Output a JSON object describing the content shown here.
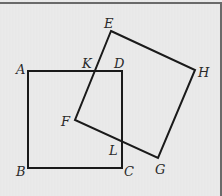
{
  "diagram": {
    "title": "",
    "colors": {
      "line": "#1a1a1a",
      "background": "#e9e9e9",
      "label": "#2a2a2a",
      "frame": "#6a6a6a"
    },
    "square1": {
      "name": "ABCD",
      "vertices": [
        "A",
        "B",
        "C",
        "D"
      ]
    },
    "square2": {
      "name": "EFGH",
      "vertices": [
        "E",
        "F",
        "G",
        "H"
      ]
    },
    "intersections": [
      "K",
      "L"
    ],
    "labels": {
      "A": "A",
      "B": "B",
      "C": "C",
      "D": "D",
      "E": "E",
      "F": "F",
      "G": "G",
      "H": "H",
      "K": "K",
      "L": "L"
    }
  }
}
